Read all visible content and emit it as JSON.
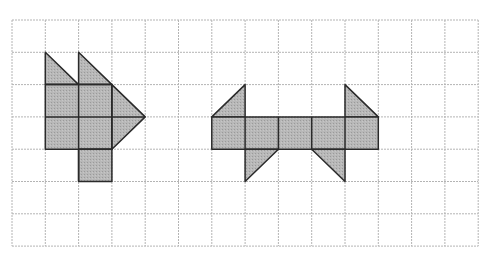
{
  "figure": {
    "type": "grid-shapes",
    "grid": {
      "columns": 14,
      "rows": 7,
      "origin_px": [
        12,
        20
      ],
      "cell_w": 33.3,
      "cell_h": 32.3,
      "line_color": "#b4b4b4"
    },
    "style": {
      "fill": "#b3b3b3",
      "stroke": "#2a2a2a"
    },
    "shapes": [
      {
        "name": "left-shape",
        "polygons": [
          [
            [
              1,
              1
            ],
            [
              2,
              2
            ],
            [
              1,
              2
            ]
          ],
          [
            [
              2,
              1
            ],
            [
              3,
              2
            ],
            [
              2,
              2
            ]
          ],
          [
            [
              1,
              2
            ],
            [
              3,
              2
            ],
            [
              3,
              4
            ],
            [
              1,
              4
            ]
          ],
          [
            [
              2,
              4
            ],
            [
              3,
              4
            ],
            [
              3,
              5
            ],
            [
              2,
              5
            ]
          ],
          [
            [
              3,
              2
            ],
            [
              4,
              3
            ],
            [
              3,
              4
            ]
          ]
        ],
        "inner_lines": [
          [
            [
              2,
              2
            ],
            [
              2,
              5
            ]
          ],
          [
            [
              1,
              3
            ],
            [
              4,
              3
            ]
          ],
          [
            [
              3,
              2
            ],
            [
              3,
              4
            ]
          ],
          [
            [
              1,
              2
            ],
            [
              3,
              2
            ]
          ],
          [
            [
              2,
              4
            ],
            [
              3,
              4
            ]
          ]
        ]
      },
      {
        "name": "right-shape",
        "polygons": [
          [
            [
              7,
              2
            ],
            [
              7,
              3
            ],
            [
              6,
              3
            ]
          ],
          [
            [
              10,
              2
            ],
            [
              11,
              3
            ],
            [
              10,
              3
            ]
          ],
          [
            [
              6,
              3
            ],
            [
              11,
              3
            ],
            [
              11,
              4
            ],
            [
              6,
              4
            ]
          ],
          [
            [
              7,
              4
            ],
            [
              8,
              4
            ],
            [
              7,
              5
            ]
          ],
          [
            [
              9,
              4
            ],
            [
              10,
              4
            ],
            [
              10,
              5
            ]
          ]
        ],
        "inner_lines": [
          [
            [
              7,
              3
            ],
            [
              7,
              4
            ]
          ],
          [
            [
              8,
              3
            ],
            [
              8,
              4
            ]
          ],
          [
            [
              9,
              3
            ],
            [
              9,
              4
            ]
          ],
          [
            [
              10,
              3
            ],
            [
              10,
              4
            ]
          ]
        ]
      }
    ]
  }
}
